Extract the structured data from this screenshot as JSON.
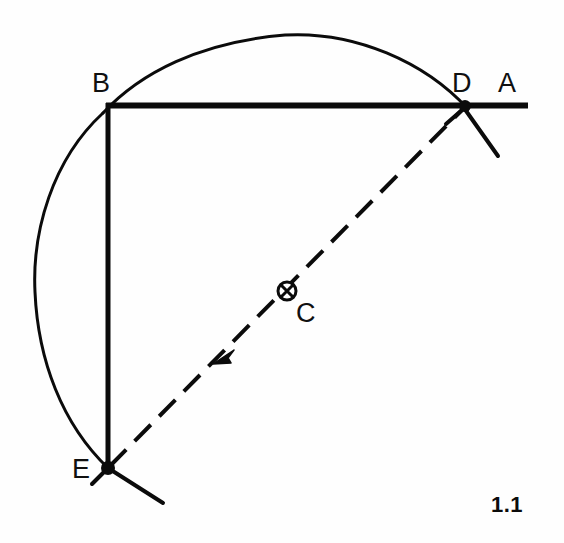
{
  "figure": {
    "number": "1.1",
    "type": "geometric-construction-diagram",
    "background_color": "#fefefe",
    "ink_color": "#0b0b0b",
    "canvas": {
      "width": 564,
      "height": 543
    }
  },
  "labels": {
    "a": "A",
    "b": "B",
    "c": "C",
    "d": "D",
    "e": "E"
  },
  "points": {
    "A": {
      "label": "A",
      "x": 528,
      "y": 106,
      "label_x": 498,
      "label_y": 70,
      "marker": "none"
    },
    "B": {
      "label": "B",
      "x": 108,
      "y": 105,
      "label_x": 92,
      "label_y": 70,
      "marker": "corner"
    },
    "C": {
      "label": "C",
      "x": 287,
      "y": 291,
      "label_x": 296,
      "label_y": 300,
      "marker": "circled-cross"
    },
    "D": {
      "label": "D",
      "x": 465,
      "y": 106,
      "label_x": 452,
      "label_y": 70,
      "marker": "intersection-dot"
    },
    "E": {
      "label": "E",
      "x": 108,
      "y": 468,
      "label_x": 72,
      "label_y": 456,
      "marker": "intersection-dot"
    }
  },
  "segments": {
    "horizontal_ba": {
      "name": "line-ba",
      "from": "B",
      "to": "A",
      "style": "solid",
      "thickness": 5
    },
    "vertical_be": {
      "name": "line-be",
      "from": "B",
      "to": "E",
      "style": "solid",
      "thickness": 4
    },
    "diagonal_ed": {
      "name": "line-ed",
      "from": "E",
      "to": "D",
      "style": "dashed",
      "thickness": 4,
      "dash_pattern": "22 11",
      "arrow": "toward-E"
    }
  },
  "arc": {
    "name": "construction-arc",
    "center": "C",
    "center_x": 287,
    "center_y": 291,
    "radius": 256,
    "start_angle_deg": 136,
    "end_angle_deg": -13,
    "thickness": 3,
    "style": "solid"
  },
  "tick_marks": {
    "at_D": [
      "arc-crossing-upper-left",
      "arc-crossing-lower-right"
    ],
    "at_E": [
      "arc-crossing-upper-left",
      "arc-crossing-lower-right"
    ]
  },
  "arrow": {
    "name": "direction-arrow",
    "x": 222,
    "y": 355,
    "points_toward": "E"
  }
}
